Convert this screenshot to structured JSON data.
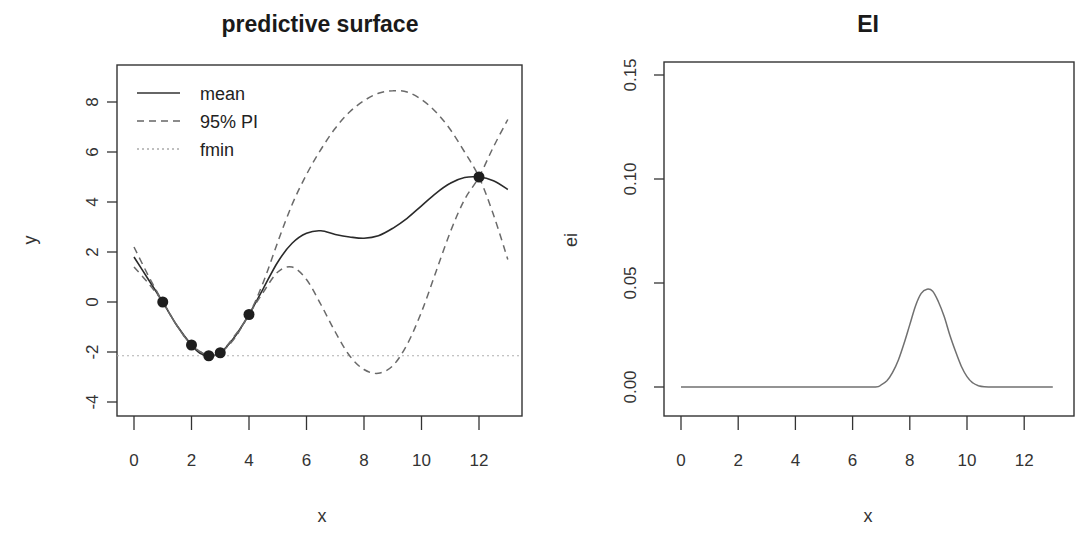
{
  "chart_data": [
    {
      "type": "line",
      "title": "predictive surface",
      "xlabel": "x",
      "ylabel": "y",
      "xlim": [
        0,
        13
      ],
      "ylim": [
        -4.5,
        9.5
      ],
      "xticks": [
        0,
        2,
        4,
        6,
        8,
        10,
        12
      ],
      "yticks": [
        -4,
        -2,
        0,
        2,
        4,
        6,
        8
      ],
      "grid": false,
      "legend": {
        "position": "top-left",
        "entries": [
          {
            "label": "mean",
            "style": "solid"
          },
          {
            "label": "95% PI",
            "style": "dashed"
          },
          {
            "label": "fmin",
            "style": "dotted"
          }
        ]
      },
      "points": {
        "x": [
          1.0,
          2.0,
          2.6,
          3.0,
          4.0,
          12.0
        ],
        "y": [
          0.0,
          -1.72,
          -2.15,
          -2.03,
          -0.5,
          5.0
        ]
      },
      "fmin": -2.15,
      "series": [
        {
          "name": "mean",
          "style": "solid",
          "x": [
            0,
            0.5,
            1,
            1.5,
            2,
            2.3,
            2.6,
            3,
            3.5,
            4,
            4.5,
            5,
            5.5,
            6,
            6.5,
            7,
            7.5,
            8,
            8.5,
            9,
            9.5,
            10,
            10.5,
            11,
            11.5,
            12,
            12.5,
            13
          ],
          "y": [
            1.8,
            0.9,
            0.0,
            -0.95,
            -1.72,
            -2.05,
            -2.15,
            -2.03,
            -1.4,
            -0.5,
            0.55,
            1.6,
            2.35,
            2.75,
            2.85,
            2.7,
            2.6,
            2.55,
            2.65,
            2.95,
            3.35,
            3.85,
            4.35,
            4.75,
            4.98,
            5.0,
            4.85,
            4.5
          ]
        },
        {
          "name": "95% PI upper",
          "style": "dashed",
          "x": [
            0,
            0.5,
            1,
            1.5,
            2,
            2.6,
            3,
            3.5,
            4,
            4.5,
            5,
            5.5,
            6,
            6.5,
            7,
            7.5,
            8,
            8.5,
            9,
            9.5,
            10,
            10.5,
            11,
            11.5,
            12,
            12.5,
            13
          ],
          "y": [
            2.2,
            1.05,
            0.0,
            -0.95,
            -1.72,
            -2.15,
            -2.03,
            -1.35,
            -0.5,
            0.8,
            2.4,
            3.9,
            5.1,
            6.1,
            6.95,
            7.6,
            8.05,
            8.35,
            8.45,
            8.4,
            8.1,
            7.6,
            6.9,
            6.0,
            5.0,
            3.5,
            1.7
          ]
        },
        {
          "name": "95% PI lower",
          "style": "dashed",
          "x": [
            0,
            0.5,
            1,
            1.5,
            2,
            2.6,
            3,
            3.5,
            4,
            4.5,
            5,
            5.5,
            6,
            6.5,
            7,
            7.5,
            8,
            8.5,
            9,
            9.5,
            10,
            10.5,
            11,
            11.5,
            12,
            12.5,
            13
          ],
          "y": [
            1.4,
            0.75,
            0.0,
            -0.95,
            -1.72,
            -2.15,
            -2.03,
            -1.45,
            -0.5,
            0.4,
            1.2,
            1.4,
            0.9,
            -0.1,
            -1.2,
            -2.15,
            -2.7,
            -2.85,
            -2.55,
            -1.7,
            -0.4,
            1.2,
            2.8,
            4.1,
            5.0,
            6.2,
            7.3
          ]
        }
      ]
    },
    {
      "type": "line",
      "title": "EI",
      "xlabel": "x",
      "ylabel": "ei",
      "xlim": [
        0,
        13
      ],
      "ylim": [
        -0.0075,
        0.158
      ],
      "xticks": [
        0,
        2,
        4,
        6,
        8,
        10,
        12
      ],
      "yticks": [
        0.0,
        0.05,
        0.1,
        0.15
      ],
      "ytick_labels": [
        "0.00",
        "0.05",
        "0.10",
        "0.15"
      ],
      "grid": false,
      "series": [
        {
          "name": "ei",
          "style": "solid",
          "x": [
            0,
            1,
            2,
            3,
            4,
            5,
            6,
            6.8,
            7.0,
            7.2,
            7.4,
            7.6,
            7.8,
            8.0,
            8.2,
            8.4,
            8.6,
            8.8,
            9.0,
            9.2,
            9.4,
            9.6,
            9.8,
            10.0,
            10.2,
            10.4,
            10.6,
            11,
            12,
            13
          ],
          "y": [
            0,
            0,
            0,
            0,
            0,
            0,
            0,
            0.0,
            0.001,
            0.003,
            0.007,
            0.013,
            0.021,
            0.03,
            0.039,
            0.045,
            0.047,
            0.046,
            0.041,
            0.034,
            0.025,
            0.017,
            0.01,
            0.005,
            0.002,
            0.0006,
            0.0001,
            0,
            0,
            0
          ]
        }
      ]
    }
  ]
}
